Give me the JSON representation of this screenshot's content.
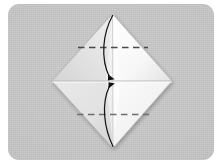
{
  "scene": {
    "title": "Origami fold diagram step",
    "background_color": "#ffffff",
    "panel": {
      "fill_color": "#c4c4c4",
      "corner_radius": 11,
      "x": 8,
      "y": 4,
      "width": 206,
      "height": 156
    }
  },
  "diagram": {
    "type": "origami-step",
    "shape_name": "square-rotated-45-diamond",
    "vertices": {
      "top": {
        "x": 112.5,
        "y": 14
      },
      "right": {
        "x": 172,
        "y": 81
      },
      "bottom": {
        "x": 113,
        "y": 148
      },
      "left": {
        "x": 52,
        "y": 81
      }
    },
    "facets": [
      {
        "name": "upper-left-facet",
        "fill_color": "#e2e2e2"
      },
      {
        "name": "upper-right-facet",
        "fill_color": "#fbfbfb"
      },
      {
        "name": "lower-left-facet",
        "fill_color": "#e6e6e6"
      },
      {
        "name": "lower-right-facet",
        "fill_color": "#f7f7f7"
      }
    ],
    "creases": [
      {
        "name": "horizontal-center-crease",
        "style": "solid",
        "color": "#b9b9b9",
        "y": 81
      },
      {
        "name": "vertical-center-crease",
        "style": "solid",
        "color": "#c8c8c8",
        "x": 112.7
      }
    ],
    "fold_lines": [
      {
        "name": "upper-dashed-fold-line",
        "style": "dashed",
        "color": "#4a4a4a",
        "y": 47.5,
        "x_start": 78,
        "x_end": 148
      },
      {
        "name": "lower-dashed-fold-line",
        "style": "dashed",
        "color": "#6e6e6e",
        "y": 114.5,
        "x_start": 77,
        "x_end": 149
      }
    ],
    "fold_arrow": {
      "name": "curved-fold-arrow",
      "color": "#1a1a1a",
      "stroke_width": 1.2,
      "arrowhead_at": {
        "x": 113,
        "y": 81
      },
      "path_from": {
        "x": 112.5,
        "y": 16
      },
      "path_to": {
        "x": 113,
        "y": 146
      },
      "bulge_direction": "left"
    }
  }
}
